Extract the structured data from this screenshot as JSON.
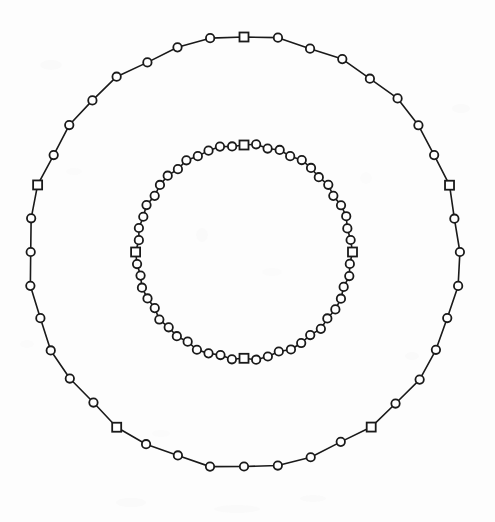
{
  "figure": {
    "background_color": "#fdfdfd",
    "ink_color": "#1a1a1a",
    "marker_fill": "#ffffff",
    "title": "",
    "caption": ""
  },
  "chart_data": {
    "type": "scatter",
    "title": "",
    "subtitle": "",
    "xlabel": "",
    "ylabel": "",
    "xlim": [
      -1.15,
      1.15
    ],
    "ylim": [
      -1.15,
      1.15
    ],
    "grid": false,
    "legend_position": "none",
    "axes_visible": false,
    "tick_labels_x": [],
    "tick_labels_y": [],
    "annotations": [],
    "coordinate_system": "cartesian-centered",
    "center_px": [
      244,
      252
    ],
    "series": [
      {
        "name": "outer-orbit",
        "marker_cycle": [
          "square",
          "circle",
          "circle",
          "circle",
          "circle",
          "circle",
          "circle",
          "circle"
        ],
        "line_style": "solid",
        "line_width_px": 1.6,
        "radius_px": 215,
        "n_points": 40,
        "start_angle_deg": -90,
        "radius_jitter_px": [
          0,
          2.0,
          -1.2,
          1.5,
          -0.8,
          2.2,
          0.6,
          -1.6,
          1.1,
          -2.0,
          0.9,
          1.8,
          -1.3,
          0.4,
          2.1,
          -0.7,
          1.4,
          -1.9,
          0.8,
          1.2,
          -0.5,
          2.3,
          -1.1,
          0.7,
          1.6,
          -2.1,
          0.3,
          1.9,
          -0.9,
          1.3,
          -1.7,
          0.5,
          2.0,
          -1.4,
          1.0,
          -0.6,
          1.7,
          -2.2,
          0.2,
          1.5
        ]
      },
      {
        "name": "inner-orbit",
        "marker_cycle": [
          "square",
          "circle",
          "circle",
          "circle",
          "circle",
          "circle",
          "circle",
          "circle",
          "circle",
          "circle",
          "circle",
          "circle",
          "circle",
          "circle"
        ],
        "line_style": "solid",
        "line_width_px": 1.6,
        "radius_px": 107,
        "n_points": 56,
        "start_angle_deg": -90,
        "radius_jitter_px": [
          0,
          1.4,
          -0.9,
          1.1,
          -0.6,
          1.6,
          0.5,
          -1.2,
          0.8,
          -1.5,
          0.7,
          1.3,
          -1.0,
          0.3,
          1.5,
          -0.5,
          1.0,
          -1.4,
          0.6,
          0.9,
          -0.4,
          1.7,
          -0.8,
          0.5,
          1.2,
          -1.6,
          0.2,
          1.4,
          -0.7,
          1.0,
          -1.3,
          0.4,
          1.5,
          -1.1,
          0.7,
          -0.5,
          1.3,
          -1.6,
          0.1,
          1.1,
          -0.9,
          0.6,
          1.4,
          -1.2,
          0.8,
          -0.3,
          1.2,
          -1.5,
          0.5,
          0.9,
          -1.0,
          1.3,
          -0.6,
          0.4,
          1.1,
          -0.8
        ]
      }
    ]
  },
  "markers": {
    "circle": {
      "shape": "open-circle",
      "radius_px": 4.2,
      "stroke_width_px": 1.8
    },
    "square": {
      "shape": "open-square",
      "size_px": 9.0,
      "stroke_width_px": 1.8
    }
  },
  "scan_artifacts": {
    "enabled": true,
    "smudges": [
      {
        "x": 452,
        "y": 104,
        "w": 18,
        "h": 9,
        "opacity": 0.06
      },
      {
        "x": 40,
        "y": 60,
        "w": 22,
        "h": 10,
        "opacity": 0.05
      },
      {
        "x": 405,
        "y": 352,
        "w": 14,
        "h": 8,
        "opacity": 0.05
      },
      {
        "x": 116,
        "y": 498,
        "w": 30,
        "h": 9,
        "opacity": 0.06
      },
      {
        "x": 214,
        "y": 505,
        "w": 46,
        "h": 8,
        "opacity": 0.05
      },
      {
        "x": 300,
        "y": 495,
        "w": 26,
        "h": 7,
        "opacity": 0.05
      },
      {
        "x": 66,
        "y": 168,
        "w": 16,
        "h": 7,
        "opacity": 0.04
      },
      {
        "x": 196,
        "y": 228,
        "w": 12,
        "h": 14,
        "opacity": 0.05
      },
      {
        "x": 262,
        "y": 268,
        "w": 20,
        "h": 8,
        "opacity": 0.04
      },
      {
        "x": 152,
        "y": 430,
        "w": 18,
        "h": 7,
        "opacity": 0.04
      },
      {
        "x": 360,
        "y": 172,
        "w": 12,
        "h": 12,
        "opacity": 0.04
      },
      {
        "x": 20,
        "y": 340,
        "w": 14,
        "h": 8,
        "opacity": 0.04
      }
    ]
  }
}
